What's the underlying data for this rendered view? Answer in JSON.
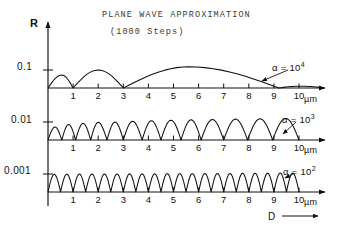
{
  "figure": {
    "title": "PLANE WAVE APPROXIMATION",
    "subtitle": "(1000 Steps)",
    "y_axis_name": "R",
    "x_axis_name": "D",
    "x_unit": "µm"
  },
  "chart_data": {
    "type": "line",
    "title": "PLANE WAVE APPROXIMATION",
    "subtitle": "(1000 Steps)",
    "xlabel": "D",
    "xunit": "µm",
    "ylabel": "R",
    "xlim": [
      0,
      11.2
    ],
    "xticks": [
      1,
      2,
      3,
      4,
      5,
      6,
      7,
      8,
      9,
      10
    ],
    "xticklabels": [
      "1",
      "2",
      "3",
      "4",
      "5",
      "6",
      "7",
      "8",
      "9",
      "10"
    ],
    "grid": false,
    "legend": "inline-annotation",
    "panels": [
      {
        "name": "panel-alpha-1e4",
        "annotation": "α = 10",
        "annotation_exponent": "4",
        "ytick_label": "0.1",
        "ytick_value": 0.1,
        "ylim": [
          0,
          0.135
        ],
        "fringe_count": 4,
        "zeros": [
          0.0,
          1.0,
          3.0,
          9.2
        ],
        "peaks": [
          {
            "x": 0.55,
            "y": 0.072
          },
          {
            "x": 2.0,
            "y": 0.1
          },
          {
            "x": 5.6,
            "y": 0.118
          },
          {
            "x": 10.05,
            "y": 0.012
          }
        ]
      },
      {
        "name": "panel-alpha-1e3",
        "annotation": "α = 10",
        "annotation_exponent": "3",
        "ytick_label": "0.01",
        "ytick_value": 0.01,
        "ylim": [
          0,
          0.0135
        ],
        "fringe_count": 13,
        "zeros": [
          0.0,
          0.55,
          1.1,
          1.7,
          2.35,
          3.0,
          3.75,
          4.5,
          5.3,
          6.1,
          7.0,
          7.95,
          8.95,
          10.0
        ],
        "peaks": [
          {
            "x": 0.28,
            "y": 0.0072
          },
          {
            "x": 0.82,
            "y": 0.0086
          },
          {
            "x": 1.4,
            "y": 0.0092
          },
          {
            "x": 2.0,
            "y": 0.0098
          },
          {
            "x": 2.67,
            "y": 0.01
          },
          {
            "x": 3.37,
            "y": 0.0104
          },
          {
            "x": 4.12,
            "y": 0.0107
          },
          {
            "x": 4.9,
            "y": 0.011
          },
          {
            "x": 5.7,
            "y": 0.0112
          },
          {
            "x": 6.55,
            "y": 0.0114
          },
          {
            "x": 7.47,
            "y": 0.0116
          },
          {
            "x": 8.45,
            "y": 0.0118
          },
          {
            "x": 9.47,
            "y": 0.012
          }
        ]
      },
      {
        "name": "panel-alpha-1e2",
        "annotation": "α = 10",
        "annotation_exponent": "2",
        "ytick_label": "0.001",
        "ytick_value": 0.001,
        "ylim": [
          0,
          0.00135
        ],
        "fringe_count": 20,
        "zeros": [
          0.0,
          0.5,
          1.0,
          1.5,
          2.0,
          2.5,
          3.0,
          3.5,
          4.0,
          4.5,
          5.0,
          5.5,
          6.0,
          6.5,
          7.0,
          7.5,
          8.0,
          8.5,
          9.0,
          9.5,
          10.0
        ],
        "peaks": [
          {
            "x": 0.25,
            "y": 0.00098
          },
          {
            "x": 0.75,
            "y": 0.00099
          },
          {
            "x": 1.25,
            "y": 0.001
          },
          {
            "x": 1.75,
            "y": 0.001
          },
          {
            "x": 2.25,
            "y": 0.001
          },
          {
            "x": 2.75,
            "y": 0.001
          },
          {
            "x": 3.25,
            "y": 0.00101
          },
          {
            "x": 3.75,
            "y": 0.00101
          },
          {
            "x": 4.25,
            "y": 0.00101
          },
          {
            "x": 4.75,
            "y": 0.00102
          },
          {
            "x": 5.25,
            "y": 0.00102
          },
          {
            "x": 5.75,
            "y": 0.00102
          },
          {
            "x": 6.25,
            "y": 0.00103
          },
          {
            "x": 6.75,
            "y": 0.00103
          },
          {
            "x": 7.25,
            "y": 0.00103
          },
          {
            "x": 7.75,
            "y": 0.00104
          },
          {
            "x": 8.25,
            "y": 0.00104
          },
          {
            "x": 8.75,
            "y": 0.00104
          },
          {
            "x": 9.25,
            "y": 0.00105
          },
          {
            "x": 9.75,
            "y": 0.00105
          }
        ]
      }
    ]
  }
}
